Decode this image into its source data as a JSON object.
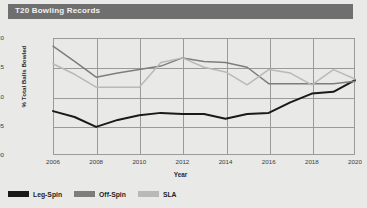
{
  "header": {
    "title": "T20 Bowling Records"
  },
  "legend": {
    "items": [
      {
        "label": "Leg-Spin",
        "color": "#1a1a1a"
      },
      {
        "label": "Off-Spin",
        "color": "#7d7d7d"
      },
      {
        "label": "SLA",
        "color": "#b9b9b9"
      }
    ]
  },
  "chart_data": {
    "type": "line",
    "title": "T20 Bowling Records",
    "xlabel": "Year",
    "ylabel": "% Total Balls Bowled",
    "x": [
      2006,
      2007,
      2008,
      2009,
      2010,
      2011,
      2012,
      2013,
      2014,
      2015,
      2016,
      2017,
      2018,
      2019,
      2020
    ],
    "xlim": [
      2006,
      2020
    ],
    "ylim": [
      0.0,
      0.2
    ],
    "xticks": [
      2006,
      2008,
      2010,
      2012,
      2014,
      2016,
      2018,
      2020
    ],
    "yticks": [
      0.0,
      0.05,
      0.1,
      0.15,
      0.2
    ],
    "ytick_labels": [
      "0.00",
      "0.05",
      "0.10",
      "0.15",
      "0.20"
    ],
    "xtick_labels": [
      "2006",
      "2008",
      "2010",
      "2012",
      "2014",
      "2016",
      "2018",
      "2020"
    ],
    "grid": true,
    "legend_position": "below-left",
    "series": [
      {
        "name": "Leg-Spin",
        "color": "#1a1a1a",
        "values": [
          0.075,
          0.065,
          0.048,
          0.06,
          0.068,
          0.072,
          0.07,
          0.07,
          0.062,
          0.07,
          0.072,
          0.09,
          0.105,
          0.108,
          0.128
        ]
      },
      {
        "name": "Off-Spin",
        "color": "#7d7d7d",
        "values": [
          0.186,
          0.16,
          0.133,
          0.14,
          0.146,
          0.152,
          0.166,
          0.16,
          0.158,
          0.15,
          0.122,
          0.122,
          0.122,
          0.122,
          0.126
        ]
      },
      {
        "name": "SLA",
        "color": "#b9b9b9",
        "values": [
          0.156,
          0.138,
          0.116,
          0.116,
          0.116,
          0.158,
          0.166,
          0.15,
          0.142,
          0.12,
          0.146,
          0.14,
          0.12,
          0.146,
          0.13
        ]
      }
    ]
  }
}
